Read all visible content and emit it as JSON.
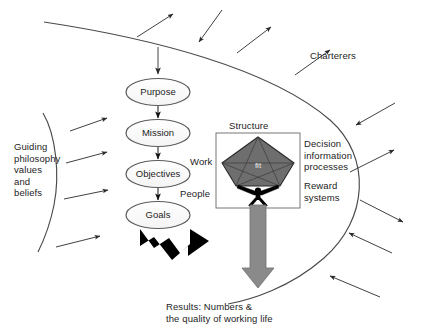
{
  "diagram": {
    "colors": {
      "stroke": "#4a4a4a",
      "text": "#1d1d1d",
      "pentagon_fill": "#6e6e6e",
      "grey_arrow": "#8a8a8a",
      "black_arrow": "#000000",
      "background": "#ffffff"
    },
    "chain": [
      {
        "label": "Purpose"
      },
      {
        "label": "Mission"
      },
      {
        "label": "Objectives"
      },
      {
        "label": "Goals"
      }
    ],
    "center_box": {
      "pentagon_label": "fit",
      "top_label": "Structure",
      "left_label": "Work",
      "bottom_left_label": "People"
    },
    "right_labels": {
      "decision": "Decision",
      "information": "information",
      "processes": "processes",
      "reward": "Reward",
      "systems": "systems"
    },
    "environment": {
      "charterers": "Charterers",
      "guiding": [
        "Guiding",
        "philosophy",
        "values",
        "and",
        "beliefs"
      ]
    },
    "results": {
      "line1": "Results: Numbers &",
      "line2": "the quality of working life"
    }
  }
}
